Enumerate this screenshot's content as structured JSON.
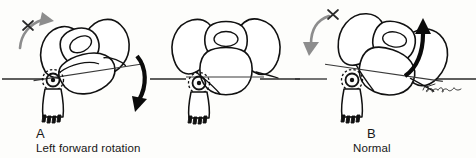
{
  "figure": {
    "type": "anatomical-line-drawing",
    "view": "superior-anterior oblique view of pelvis with left foot",
    "background_color": "#fdfdfb",
    "ink_color": "#111111",
    "accent_gray": "#8d8d8d",
    "signature": "artist signature (cursive, illegible)"
  },
  "panels": [
    {
      "id": "a",
      "label": "A",
      "caption": "Left forward rotation",
      "horizontal_reference_line": true,
      "pelvis_tilt_degrees": -18,
      "tilt_line": true,
      "gray_arrow": {
        "name": "restricted-motion-arrow",
        "direction": "up-right",
        "marked_with_x": true
      },
      "black_arrow": {
        "name": "rotation-direction-arrow",
        "direction": "down",
        "position": "right"
      },
      "hip_joint_marker": true,
      "foot": true
    },
    {
      "id": "b",
      "label": "B",
      "caption": "Normal",
      "horizontal_reference_line": true,
      "pelvis_tilt_degrees": 0,
      "tilt_line": false,
      "gray_arrow": null,
      "black_arrow": null,
      "hip_joint_marker": true,
      "foot": true
    },
    {
      "id": "c",
      "label": "C",
      "caption": "Left backward rotation",
      "horizontal_reference_line": true,
      "pelvis_tilt_degrees": 16,
      "tilt_line": true,
      "gray_arrow": {
        "name": "restricted-motion-arrow",
        "direction": "down-left",
        "marked_with_x": true
      },
      "black_arrow": {
        "name": "rotation-direction-arrow",
        "direction": "up",
        "position": "right"
      },
      "hip_joint_marker": true,
      "foot": true
    }
  ]
}
